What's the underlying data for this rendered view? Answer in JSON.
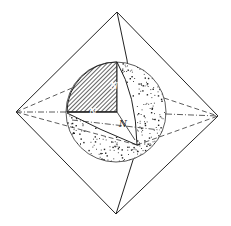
{
  "figure": {
    "labels": {
      "n_vertical": "N",
      "n_horizontal": "N",
      "n_diagonal": "N"
    },
    "colors": {
      "line": "#222222",
      "background": "#ffffff"
    },
    "geometry": {
      "vertices": {
        "top": [
          117,
          12
        ],
        "bottom": [
          116,
          214
        ],
        "left": [
          16,
          112
        ],
        "right": [
          218,
          116
        ],
        "front_top_edge_point": [
          137,
          145
        ]
      },
      "sphere": {
        "cx": 116,
        "cy": 112,
        "r": 50
      }
    }
  }
}
